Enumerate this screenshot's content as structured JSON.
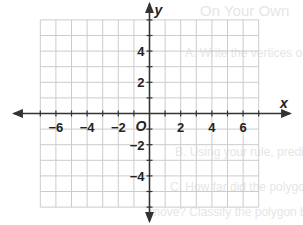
{
  "figure": {
    "type": "coordinate-plane",
    "x_axis_label": "x",
    "y_axis_label": "y",
    "origin_label": "O",
    "x_range": [
      -7,
      7
    ],
    "y_range": [
      -6,
      6
    ],
    "grid_step": 1,
    "x_tick_labels": [
      "-6",
      "-4",
      "-2",
      "2",
      "4",
      "6"
    ],
    "y_tick_labels": [
      "4",
      "2",
      "-2",
      "-4"
    ],
    "colors": {
      "grid": "#cccccc",
      "axes": "#333333",
      "labels": "#222222"
    }
  },
  "background_bleed_text": [
    "On Your Own",
    "A. Write the vertices of the polygon",
    "B. Using your rule, predict",
    "C. How far did the polygon",
    "move? Classify the polygon by the"
  ]
}
